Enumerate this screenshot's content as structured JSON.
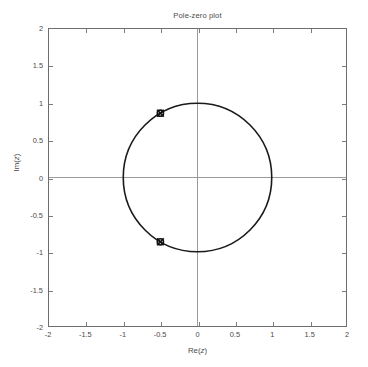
{
  "chart_data": {
    "type": "scatter",
    "title": "Pole-zero plot",
    "xlabel": "Re(z)",
    "ylabel": "Im(z)",
    "xlim": [
      -2,
      2
    ],
    "ylim": [
      -2,
      2
    ],
    "grid": false,
    "legend": null,
    "xticks": [
      -2,
      -1.5,
      -1,
      -0.5,
      0,
      0.5,
      1,
      1.5,
      2
    ],
    "xtick_labels": [
      "-2",
      "-1.5",
      "-1",
      "-0.5",
      "0",
      "0.5",
      "1",
      "1.5",
      "2"
    ],
    "yticks": [
      2,
      1.5,
      1,
      0.5,
      0,
      -0.5,
      -1,
      -1.5,
      -2
    ],
    "ytick_labels": [
      "2",
      "1.5",
      "1",
      "0.5",
      "0",
      "-0.5",
      "-1",
      "-1.5",
      "-2"
    ],
    "annotations": [
      "unit circle of radius 1 centered at origin",
      "crosshair axes at Re(z)=0 and Im(z)=0"
    ],
    "series": [
      {
        "name": "zeros",
        "marker": "o",
        "points": [
          {
            "re": -0.5,
            "im": 0.866
          },
          {
            "re": -0.5,
            "im": -0.866
          }
        ]
      },
      {
        "name": "poles",
        "marker": "x",
        "points": [
          {
            "re": -0.5,
            "im": 0.866
          },
          {
            "re": -0.5,
            "im": -0.866
          }
        ]
      }
    ],
    "reference_curve": {
      "name": "unit circle",
      "center": [
        0,
        0
      ],
      "radius": 1
    },
    "colors": {
      "axis": "#6e6e6e",
      "crosshair": "#9a9a9a",
      "curve": "#1a1a1a",
      "marker": "#111111",
      "text": "#4a4a4a",
      "background": "#ffffff"
    }
  }
}
